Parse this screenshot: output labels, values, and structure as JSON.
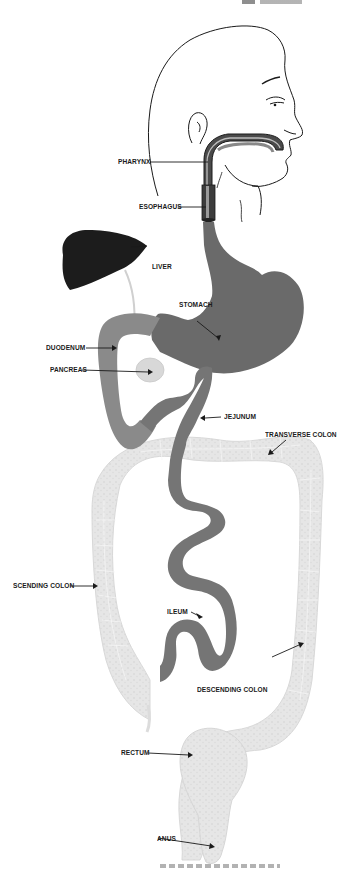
{
  "diagram": {
    "colors": {
      "outline": "#1a1a1a",
      "liver": "#1c1c1c",
      "stomach": "#6a6a6a",
      "small_intestine": "#7a7a7a",
      "duodenum": "#8a8a8a",
      "pancreas": "#d8d8d8",
      "large_intestine": "#e4e4e4",
      "background": "#ffffff"
    },
    "labels": [
      {
        "id": "pharynx",
        "text": "PHARYNX"
      },
      {
        "id": "esophagus",
        "text": "ESOPHAGUS"
      },
      {
        "id": "liver",
        "text": "LIVER"
      },
      {
        "id": "stomach",
        "text": "STOMACH"
      },
      {
        "id": "duodenum",
        "text": "DUODENUM"
      },
      {
        "id": "pancreas",
        "text": "PANCREAS"
      },
      {
        "id": "jejunum",
        "text": "JEJUNUM"
      },
      {
        "id": "transverse_colon",
        "text": "TRANSVERSE COLON"
      },
      {
        "id": "ascending_colon",
        "text": "SCENDING COLON"
      },
      {
        "id": "ileum",
        "text": "ILEUM"
      },
      {
        "id": "descending_colon",
        "text": "DESCENDING COLON"
      },
      {
        "id": "rectum",
        "text": "RECTUM"
      },
      {
        "id": "anus",
        "text": "ANUS"
      }
    ]
  }
}
